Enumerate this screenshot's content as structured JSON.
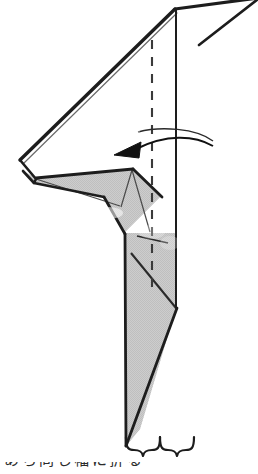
{
  "figure": {
    "kind": "origami-fold-diagram",
    "title": "",
    "colors": {
      "paper_front_fill": "#ffffff",
      "paper_back_fill": "#c9c9c9",
      "outline": "#1d1d1d",
      "crease_line": "#333333",
      "dashed_fold_line": "#3a3a3a",
      "arrow": "#111111",
      "background": "#ffffff"
    },
    "annotations": {
      "fold_line_label": "",
      "rotation_arrow_label": "",
      "brace_label": ""
    },
    "icons": {
      "fold_arrow": "curved-fold-arrow-left",
      "valley_fold": "dashed-fold-line",
      "measure": "double-brace"
    }
  },
  "geometry": {
    "outline_main": "175,8 20,160 36,180 103,196 126,232 126,445 141,428 176,307 176,8",
    "back_panel_top": "175,8 242,0 258,0 200,40",
    "gray_region_upper": "36,176 130,168 160,196 124,232 104,196 24,180",
    "gray_region_lower": "126,232 176,232 176,307 141,428 126,445",
    "vertical_solid_x": 176,
    "dashed_line_x": 152,
    "dashed_line_top_y": 40,
    "dashed_line_bottom_y": 288,
    "left_vertex": "20,160",
    "apex": "175,8",
    "bottom_tip": "126,445",
    "brace_span_px": 60,
    "brace_left_x": 125,
    "brace_right_x": 185,
    "brace_y": 452
  },
  "caption": {
    "partial_bottom_text": "あら同じ幅に折る"
  }
}
